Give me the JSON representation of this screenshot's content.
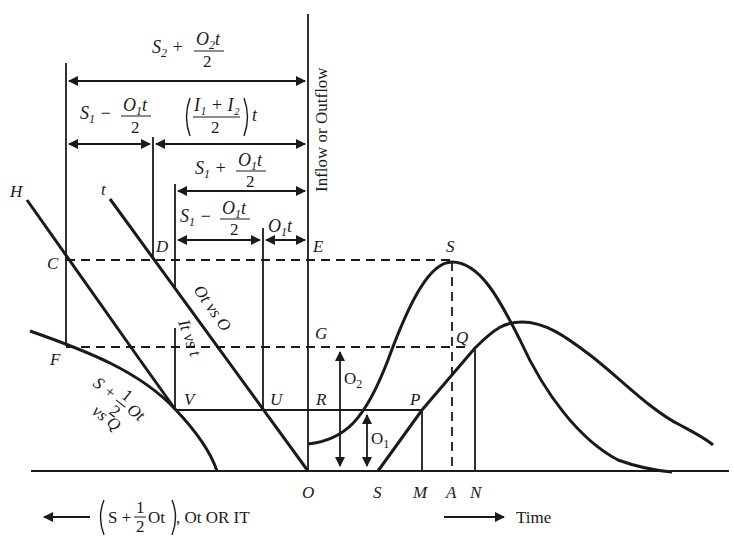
{
  "diagram": {
    "type": "flood-routing-graphical-method",
    "vertical_axis_label": "Inflow or Outflow",
    "horizontal_axis_left_label": "(S + 1/2 Ot), Ot OR IT",
    "horizontal_axis_left_parts": {
      "paren_open": "(",
      "S": "S +",
      "num": "1",
      "den": "2",
      "Ot": "Ot",
      "paren_close": ")",
      "rest": ", Ot  OR  IT"
    },
    "horizontal_axis_right_label": "Time",
    "point_labels": {
      "H": "H",
      "t": "t",
      "C": "C",
      "D": "D",
      "E": "E",
      "F": "F",
      "G": "G",
      "V": "V",
      "U": "U",
      "R": "R",
      "O": "O",
      "S_peak": "S",
      "Q": "Q",
      "P": "P",
      "S_axis": "S",
      "M": "M",
      "A": "A",
      "N": "N"
    },
    "curve_labels": {
      "ot_vs_o": "Ot vs O",
      "it_vs_t": "It vs t",
      "storage_curve_line1": "S + ",
      "storage_curve_frac_num": "1",
      "storage_curve_frac_den": "2",
      "storage_curve_ot": "Ot",
      "storage_curve_line2": "vs Q"
    },
    "dimension_labels": {
      "s2_plus": {
        "main": "S",
        "sub": "2",
        "op": " + ",
        "num_main": "O",
        "num_sub": "2",
        "num_tail": "t",
        "den": "2"
      },
      "s1_minus_top": {
        "main": "S",
        "sub": "1",
        "op": " − ",
        "num_main": "O",
        "num_sub": "1",
        "num_tail": "t",
        "den": "2"
      },
      "inflow_avg": {
        "num": "I₁ + I₂",
        "den": "2",
        "tail": "t"
      },
      "s1_plus": {
        "main": "S",
        "sub": "1",
        "op": " + ",
        "num_main": "O",
        "num_sub": "1",
        "num_tail": "t",
        "den": "2"
      },
      "s1_minus_low": {
        "main": "S",
        "sub": "1",
        "op": " − ",
        "num_main": "O",
        "num_sub": "1",
        "num_tail": "t",
        "den": "2"
      },
      "o1t": {
        "main": "O",
        "sub": "1",
        "tail": "t"
      }
    },
    "flow_labels": {
      "o1": {
        "main": "O",
        "sub": "1"
      },
      "o2": {
        "main": "O",
        "sub": "2"
      }
    }
  }
}
